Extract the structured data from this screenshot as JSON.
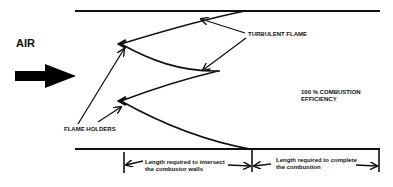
{
  "diagram": {
    "type": "combustor flame stabilization schematic",
    "colors": {
      "ink": "#111111",
      "background": "#ffffff"
    },
    "labels": {
      "air": "AIR",
      "turbulent_flame": "TURBULENT FLAME",
      "efficiency_line1": "100 % COMBUSTION",
      "efficiency_line2": "EFFICIENCY",
      "flame_holders": "FLAME HOLDERS",
      "dim_intersect_line1": "Length required to intersect",
      "dim_intersect_line2": "the combustor walls",
      "dim_complete_line1": "Length required to complete",
      "dim_complete_line2": "the combustion"
    },
    "elements": {
      "walls": [
        "top combustor wall",
        "bottom combustor wall"
      ],
      "flow_arrow": "air inflow arrow",
      "flame_holders": [
        "upper flame holder",
        "lower flame holder"
      ],
      "dimensions": [
        "intersect-walls length",
        "complete-combustion length"
      ]
    }
  }
}
